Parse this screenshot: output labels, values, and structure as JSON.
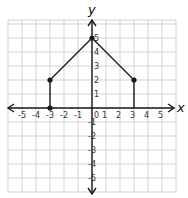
{
  "chart_data": {
    "type": "line",
    "title": "",
    "xlabel": "x",
    "ylabel": "y",
    "xlim": [
      -6,
      6
    ],
    "ylim": [
      -6,
      6
    ],
    "grid": true,
    "x_ticks": [
      "-5",
      "-4",
      "-3",
      "-2",
      "-1",
      "0",
      "1",
      "2",
      "3",
      "4",
      "5"
    ],
    "y_ticks": [
      "-5",
      "-4",
      "-3",
      "-2",
      "-1",
      "1",
      "2",
      "3",
      "4",
      "5"
    ],
    "series": [
      {
        "name": "polyline",
        "points": [
          [
            -3,
            0
          ],
          [
            -3,
            2
          ],
          [
            0,
            5
          ],
          [
            3,
            2
          ],
          [
            3,
            0
          ]
        ],
        "markers": [
          [
            -3,
            0
          ],
          [
            -3,
            2
          ],
          [
            0,
            5
          ],
          [
            3,
            2
          ]
        ]
      }
    ],
    "colors": {
      "line": "#1a1a1a",
      "grid": "#c8c8c8"
    }
  }
}
